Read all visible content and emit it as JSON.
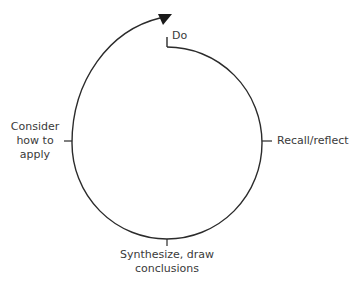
{
  "diagram": {
    "type": "cycle",
    "colors": {
      "stroke": "#2b2b2b",
      "text": "#3a3a3a",
      "background": "#ffffff"
    },
    "steps": [
      {
        "id": "do",
        "label": "Do"
      },
      {
        "id": "recall",
        "label": "Recall/reflect"
      },
      {
        "id": "synthesize",
        "label": "Synthesize, draw conclusions",
        "lines": [
          "Synthesize, draw",
          "conclusions"
        ]
      },
      {
        "id": "consider",
        "label": "Consider how to apply",
        "lines": [
          "Consider",
          "how to",
          "apply"
        ]
      }
    ],
    "arrow": {
      "direction": "clockwise",
      "ends": "outward spiral past start"
    }
  }
}
